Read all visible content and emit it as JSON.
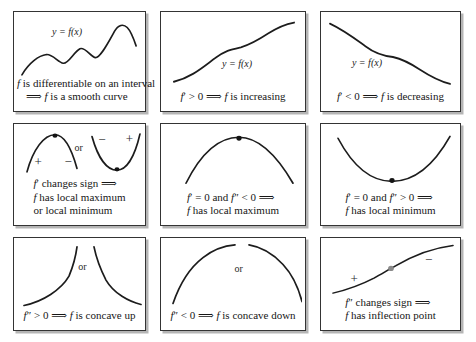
{
  "colors": {
    "background": "#ffffff",
    "panel_border": "#343434",
    "panel_shadow": "#b5b5b5",
    "curve": "#1c1c1c",
    "dot": "#141414",
    "inflection_dot": "#8a8a8a"
  },
  "panels": [
    {
      "id": "smooth-curve",
      "curve_label": "y = f(x)",
      "caption": [
        [
          {
            "t": "f",
            "m": true
          },
          {
            "t": " is differentiable on an interval",
            "m": false
          }
        ],
        [
          {
            "t": "⟹ ",
            "m": false
          },
          {
            "t": "f",
            "m": true
          },
          {
            "t": " is a smooth curve",
            "m": false
          }
        ]
      ]
    },
    {
      "id": "increasing",
      "curve_label": "y = f(x)",
      "caption": [
        [
          {
            "t": "f",
            "m": true
          },
          {
            "t": "′ > 0 ⟹ ",
            "m": false
          },
          {
            "t": "f",
            "m": true
          },
          {
            "t": " is increasing",
            "m": false
          }
        ]
      ]
    },
    {
      "id": "decreasing",
      "curve_label": "y = f(x)",
      "caption": [
        [
          {
            "t": "f",
            "m": true
          },
          {
            "t": "′ < 0 ⟹ ",
            "m": false
          },
          {
            "t": "f",
            "m": true
          },
          {
            "t": " is decreasing",
            "m": false
          }
        ]
      ]
    },
    {
      "id": "local-extremum",
      "labels": {
        "or": "or",
        "left_plus": "+",
        "left_minus": "−",
        "right_minus": "−",
        "right_plus": "+"
      },
      "caption": [
        [
          {
            "t": "f",
            "m": true
          },
          {
            "t": "′ changes sign ⟹",
            "m": false
          }
        ],
        [
          {
            "t": "f",
            "m": true
          },
          {
            "t": " has local maximum",
            "m": false
          }
        ],
        [
          {
            "t": "or local minimum",
            "m": false
          }
        ]
      ]
    },
    {
      "id": "local-maximum",
      "caption": [
        [
          {
            "t": "f",
            "m": true
          },
          {
            "t": "′ = 0 and ",
            "m": false
          },
          {
            "t": "f",
            "m": true
          },
          {
            "t": "″ < 0 ⟹",
            "m": false
          }
        ],
        [
          {
            "t": "f",
            "m": true
          },
          {
            "t": " has local maximum",
            "m": false
          }
        ]
      ]
    },
    {
      "id": "local-minimum",
      "caption": [
        [
          {
            "t": "f",
            "m": true
          },
          {
            "t": "′ = 0 and ",
            "m": false
          },
          {
            "t": "f",
            "m": true
          },
          {
            "t": "″ > 0 ⟹",
            "m": false
          }
        ],
        [
          {
            "t": "f",
            "m": true
          },
          {
            "t": " has local minimum",
            "m": false
          }
        ]
      ]
    },
    {
      "id": "concave-up",
      "labels": {
        "or": "or"
      },
      "caption": [
        [
          {
            "t": "f",
            "m": true
          },
          {
            "t": "″ > 0 ⟹ ",
            "m": false
          },
          {
            "t": "f",
            "m": true
          },
          {
            "t": " is concave up",
            "m": false
          }
        ]
      ]
    },
    {
      "id": "concave-down",
      "labels": {
        "or": "or"
      },
      "caption": [
        [
          {
            "t": "f",
            "m": true
          },
          {
            "t": "″ < 0 ⟹ ",
            "m": false
          },
          {
            "t": "f",
            "m": true
          },
          {
            "t": " is concave down",
            "m": false
          }
        ]
      ]
    },
    {
      "id": "inflection-point",
      "labels": {
        "plus": "+",
        "minus": "−"
      },
      "caption": [
        [
          {
            "t": "f",
            "m": true
          },
          {
            "t": "″ changes sign ⟹",
            "m": false
          }
        ],
        [
          {
            "t": "f",
            "m": true
          },
          {
            "t": " has inflection point",
            "m": false
          }
        ]
      ]
    }
  ]
}
